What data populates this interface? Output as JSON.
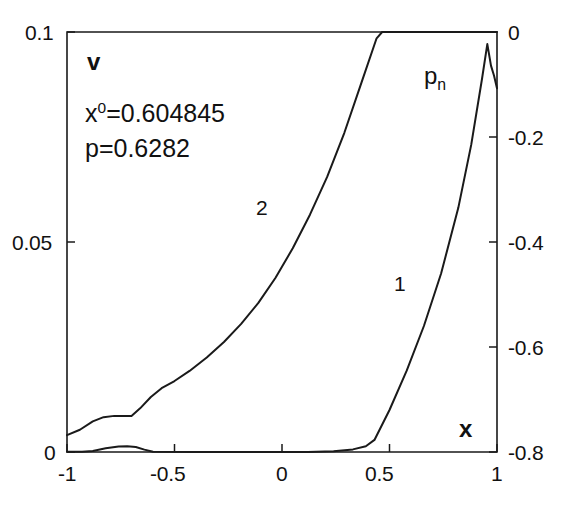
{
  "figure": {
    "background": "#ffffff",
    "line_color": "#1a1a1a"
  },
  "annotations": {
    "left_axis_name": "v",
    "right_axis_name_base": "p",
    "right_axis_name_sub": "n",
    "x_axis_name": "x",
    "param_x0_prefix": "x",
    "param_x0_sup": "0",
    "param_x0_value": "=0.604845",
    "param_p": "p=0.6282",
    "curve1_label": "1",
    "curve2_label": "2"
  },
  "axes": {
    "x": {
      "label": "x",
      "min": -1,
      "max": 1,
      "ticks": [
        -1,
        -0.5,
        0,
        0.5,
        1
      ],
      "tick_labels": [
        "-1",
        "-0.5",
        "0",
        "0.5",
        "1"
      ]
    },
    "y_left": {
      "label": "v",
      "min": 0,
      "max": 0.1,
      "ticks": [
        0,
        0.05,
        0.1
      ],
      "tick_labels": [
        "0",
        "0.05",
        "0.1"
      ]
    },
    "y_right": {
      "label": "p_n",
      "min": -0.8,
      "max": 0,
      "ticks": [
        0,
        -0.2,
        -0.4,
        -0.6,
        -0.8
      ],
      "tick_labels": [
        "0",
        "-0.2",
        "-0.4",
        "-0.6",
        "-0.8"
      ]
    }
  },
  "chart_data": {
    "type": "line",
    "title": "",
    "xlabel": "x",
    "ylabel": "v",
    "y2label": "p_n",
    "xlim": [
      -1,
      1
    ],
    "ylim": [
      0,
      0.1
    ],
    "y2lim": [
      -0.8,
      0
    ],
    "grid": false,
    "legend": "inline-curve-labels",
    "annotations": {
      "x0": 0.604845,
      "p": 0.6282
    },
    "series": [
      {
        "name": "2",
        "axis": "left",
        "label_position": {
          "x": -0.09,
          "y": 0.0585
        },
        "points": [
          [
            -1.0,
            0.004
          ],
          [
            -0.94,
            0.0053
          ],
          [
            -0.88,
            0.0073
          ],
          [
            -0.83,
            0.0083
          ],
          [
            -0.78,
            0.0086
          ],
          [
            -0.7,
            0.0086
          ],
          [
            -0.66,
            0.0104
          ],
          [
            -0.61,
            0.0131
          ],
          [
            -0.56,
            0.0152
          ],
          [
            -0.5,
            0.0169
          ],
          [
            -0.43,
            0.0193
          ],
          [
            -0.35,
            0.0225
          ],
          [
            -0.27,
            0.0262
          ],
          [
            -0.19,
            0.0305
          ],
          [
            -0.11,
            0.0355
          ],
          [
            -0.03,
            0.0415
          ],
          [
            0.05,
            0.0485
          ],
          [
            0.13,
            0.0565
          ],
          [
            0.21,
            0.0655
          ],
          [
            0.29,
            0.076
          ],
          [
            0.37,
            0.088
          ],
          [
            0.44,
            0.0985
          ],
          [
            0.466,
            0.1
          ],
          [
            0.6,
            0.1
          ],
          [
            0.75,
            0.1
          ],
          [
            0.9,
            0.1
          ],
          [
            1.0,
            0.1
          ]
        ]
      },
      {
        "name": "1",
        "axis": "right",
        "label_position": {
          "x": 0.49,
          "y": -0.355
        },
        "points": [
          [
            -1.0,
            -0.7995
          ],
          [
            -0.93,
            -0.7995
          ],
          [
            -0.88,
            -0.798
          ],
          [
            -0.82,
            -0.793
          ],
          [
            -0.76,
            -0.7895
          ],
          [
            -0.72,
            -0.789
          ],
          [
            -0.68,
            -0.7905
          ],
          [
            -0.64,
            -0.7955
          ],
          [
            -0.6,
            -0.7995
          ],
          [
            -0.4,
            -0.8
          ],
          [
            -0.2,
            -0.8
          ],
          [
            0.0,
            -0.8
          ],
          [
            0.12,
            -0.8
          ],
          [
            0.24,
            -0.7985
          ],
          [
            0.33,
            -0.795
          ],
          [
            0.39,
            -0.789
          ],
          [
            0.43,
            -0.777
          ],
          [
            0.5,
            -0.72
          ],
          [
            0.58,
            -0.645
          ],
          [
            0.66,
            -0.56
          ],
          [
            0.74,
            -0.46
          ],
          [
            0.82,
            -0.335
          ],
          [
            0.88,
            -0.215
          ],
          [
            0.93,
            -0.09
          ],
          [
            0.955,
            -0.023
          ],
          [
            0.972,
            -0.064
          ],
          [
            0.986,
            -0.083
          ],
          [
            1.0,
            -0.107
          ]
        ]
      }
    ]
  }
}
